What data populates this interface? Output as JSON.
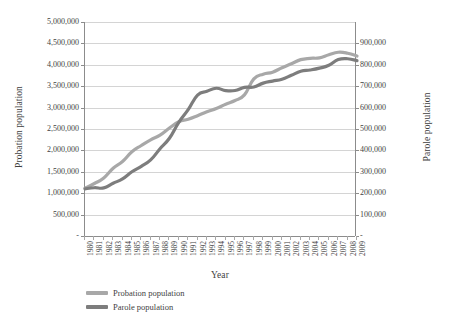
{
  "chart_data": {
    "type": "line",
    "title": "",
    "xlabel": "Year",
    "ylabel": "Probation population",
    "y2label": "Parole population",
    "grid": true,
    "legend_position": "bottom-left",
    "categories": [
      "1980",
      "1981",
      "1982",
      "1983",
      "1984",
      "1985",
      "1986",
      "1987",
      "1988",
      "1989",
      "1990",
      "1991",
      "1992",
      "1993",
      "1994",
      "1995",
      "1996",
      "1997",
      "1998",
      "1999",
      "2000",
      "2001",
      "2002",
      "2003",
      "2004",
      "2005",
      "2006",
      "2007",
      "2008",
      "2009"
    ],
    "ylim": [
      0,
      5000000
    ],
    "yticks": [
      "-",
      "500,000",
      "1,000,000",
      "1,500,000",
      "2,000,000",
      "2,500,000",
      "3,000,000",
      "3,500,000",
      "4,000,000",
      "4,500,000",
      "5,000,000"
    ],
    "y2lim": [
      0,
      900000
    ],
    "y2ticks": [
      "-",
      "100,000",
      "200,000",
      "300,000",
      "400,000",
      "500,000",
      "600,000",
      "700,000",
      "800,000",
      "900,000"
    ],
    "series": [
      {
        "name": "Probation population",
        "axis": "left",
        "color": "#a8a8a8",
        "values": [
          1118097,
          1225934,
          1357264,
          1582947,
          1740948,
          1968712,
          2114621,
          2247158,
          2356483,
          2522125,
          2670234,
          2728472,
          2811611,
          2903061,
          2981022,
          3077861,
          3164996,
          3296513,
          3670441,
          3779922,
          3826209,
          3931731,
          4024067,
          4120012,
          4151125,
          4162536,
          4236800,
          4293163,
          4270917,
          4203967
        ]
      },
      {
        "name": "Parole population",
        "axis": "right",
        "color": "#7d7d7d",
        "values": [
          220438,
          225539,
          224604,
          246440,
          266992,
          300203,
          325638,
          355505,
          407977,
          456803,
          531407,
          590442,
          658601,
          676100,
          690371,
          679421,
          679733,
          694787,
          696385,
          714457,
          723898,
          732333,
          750934,
          769925,
          775623,
          784354,
          798202,
          824365,
          828169,
          819308
        ]
      }
    ]
  },
  "legend": {
    "items": [
      {
        "label": "Probation population",
        "color": "#a8a8a8"
      },
      {
        "label": "Parole population",
        "color": "#7d7d7d"
      }
    ]
  }
}
